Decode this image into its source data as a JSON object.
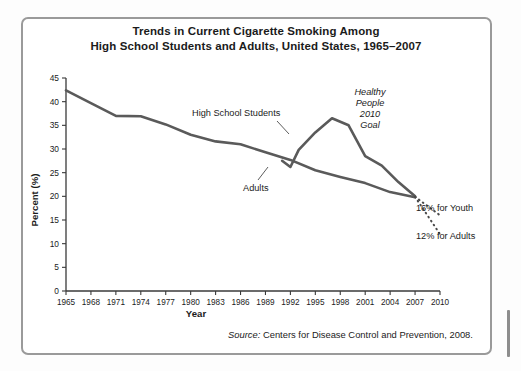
{
  "figure": {
    "title_line1": "Trends in Current Cigarette Smoking Among",
    "title_line2": "High School Students and Adults, United States, 1965–2007",
    "source_label": "Source:",
    "source_text": " Centers for Disease Control and Prevention, 2008."
  },
  "chart_data": {
    "type": "line",
    "title": "Trends in Current Cigarette Smoking Among High School Students and Adults, United States, 1965–2007",
    "xlabel": "Year",
    "ylabel": "Percent (%)",
    "xlim": [
      1965,
      2010
    ],
    "ylim": [
      0,
      45
    ],
    "xticks": [
      1965,
      1968,
      1971,
      1974,
      1977,
      1980,
      1983,
      1986,
      1989,
      1992,
      1995,
      1998,
      2001,
      2004,
      2007,
      2010
    ],
    "xtick_labels": [
      "1965",
      "1968",
      "1971",
      "1974",
      "1977",
      "1980",
      "1983",
      "1986",
      "1989",
      "1992",
      "1995",
      "1998",
      "2001",
      "2004",
      "2007",
      "2010"
    ],
    "yticks": [
      0,
      5,
      10,
      15,
      20,
      25,
      30,
      35,
      40,
      45
    ],
    "ytick_labels": [
      "0",
      "5",
      "10",
      "15",
      "20",
      "25",
      "30",
      "35",
      "40",
      "45"
    ],
    "grid": false,
    "legend": "inline-annotations",
    "series": [
      {
        "name": "Adults",
        "x": [
          1965,
          1968,
          1971,
          1974,
          1977,
          1980,
          1983,
          1986,
          1989,
          1992,
          1995,
          1998,
          2001,
          2004,
          2007
        ],
        "values": [
          42.4,
          39.7,
          37.0,
          36.9,
          35.2,
          33.0,
          31.6,
          31.0,
          29.3,
          27.7,
          25.5,
          24.1,
          22.8,
          20.9,
          19.8
        ]
      },
      {
        "name": "High School Students",
        "x": [
          1991,
          1992,
          1993,
          1995,
          1997,
          1999,
          2001,
          2003,
          2005,
          2007
        ],
        "values": [
          27.5,
          26.2,
          29.8,
          33.5,
          36.5,
          35.0,
          28.5,
          26.5,
          23.0,
          20.0
        ]
      }
    ],
    "projections": [
      {
        "name": "16% for Youth",
        "style": "dotted",
        "x": [
          2007,
          2010
        ],
        "values": [
          19.9,
          16.0
        ],
        "label": "16% for Youth"
      },
      {
        "name": "12% for Adults",
        "style": "dotted",
        "x": [
          2007,
          2010
        ],
        "values": [
          19.9,
          12.0
        ],
        "label": "12% for Adults"
      }
    ],
    "annotations": [
      {
        "name": "high-school-students-label",
        "text": "High School Students"
      },
      {
        "name": "adults-label",
        "text": "Adults"
      },
      {
        "name": "healthy-people-goal-label",
        "lines": [
          "Healthy",
          "People",
          "2010",
          "Goal"
        ],
        "style": "italic"
      },
      {
        "name": "youth-goal-label",
        "text": "16% for Youth"
      },
      {
        "name": "adults-goal-label",
        "text": "12% for Adults"
      }
    ],
    "colors": {
      "line": "#5a5a5a",
      "axis": "#3a3a3a",
      "text": "#1b1b1b",
      "frame": "#9a9a9a"
    }
  }
}
